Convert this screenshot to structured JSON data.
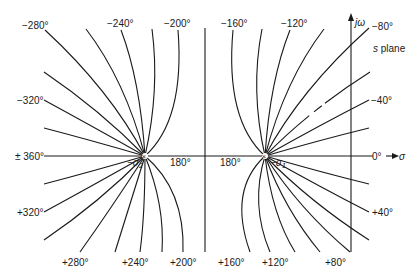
{
  "diagram": {
    "type": "root-locus-phase-contours",
    "plane_label": "s plane",
    "axes": {
      "imag_label": "jω",
      "real_label": "σ",
      "real_origin_label": "0°"
    },
    "poles": [
      {
        "name": "left-pole",
        "label": "−σ₂",
        "sub": "2"
      },
      {
        "name": "right-pole",
        "label": "−σ₁",
        "sub": "1"
      }
    ],
    "axis_labels": {
      "left_real": "± 360°",
      "center_left": "180°",
      "center_right": "180°",
      "right_real": "0°"
    },
    "top_labels": [
      "−280°",
      "−240°",
      "−200°",
      "−160°",
      "−120°",
      "−80°"
    ],
    "right_labels": [
      "−40°",
      "+40°"
    ],
    "left_labels": [
      "−320°",
      "+320°"
    ],
    "bottom_labels": [
      "+280°",
      "+240°",
      "+200°",
      "+160°",
      "+120°",
      "+80°"
    ]
  }
}
